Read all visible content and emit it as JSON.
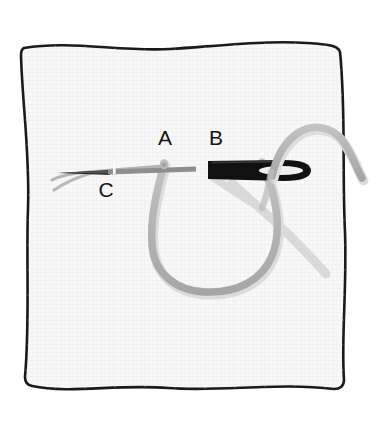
{
  "illustration": {
    "title": "Blanket stitch diagram",
    "subject": "hand embroidery stitch on fabric swatch",
    "background_color": "#ffffff",
    "fabric": {
      "name": "fabric-swatch",
      "fill_color": "#f7f7f7",
      "outline_color": "#1a1a1a",
      "outline_style": "hand-drawn wavy square"
    },
    "needle": {
      "name": "sewing-needle",
      "body_color": "#111111",
      "eye_color": "#f2f2f2",
      "orientation": "horizontal, point to the left"
    },
    "thread": {
      "name": "embroidery-thread",
      "color": "#b0b0b0",
      "shadow_color": "#cfcfcf",
      "path_description": "loop from A down and around to the right, up through needle eye and off the right edge"
    },
    "labels": [
      {
        "id": "label-a",
        "text": "A",
        "x": 165,
        "y": 145,
        "meaning": "thread emerges at point A"
      },
      {
        "id": "label-b",
        "text": "B",
        "x": 216,
        "y": 145,
        "meaning": "needle enters at point B"
      },
      {
        "id": "label-c",
        "text": "C",
        "x": 106,
        "y": 197,
        "meaning": "needle exits at point C"
      }
    ]
  }
}
